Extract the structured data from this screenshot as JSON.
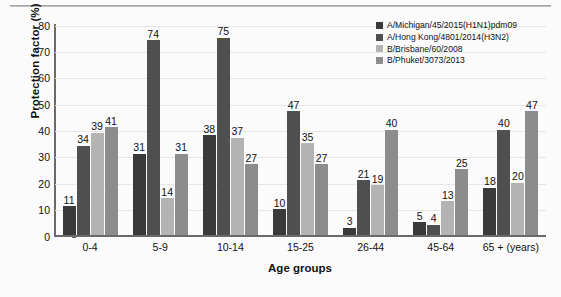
{
  "chart_data": {
    "type": "bar",
    "title": "",
    "xlabel": "Age groups",
    "ylabel": "Protection factor (%)",
    "categories": [
      "0-4",
      "5-9",
      "10-14",
      "15-25",
      "26-44",
      "45-64",
      "65 + (years)"
    ],
    "ylim": [
      0,
      80
    ],
    "yticks": [
      0,
      10,
      20,
      30,
      40,
      50,
      60,
      70,
      80
    ],
    "grid": true,
    "legend_position": "top-right",
    "series": [
      {
        "name": "A/Michigan/45/2015(H1N1)pdm09",
        "color": "#3a3a3a",
        "values": [
          11,
          31,
          38,
          10,
          3,
          5,
          18
        ]
      },
      {
        "name": "A/Hong Kong/4801/2014(H3N2)",
        "color": "#4f4f4f",
        "values": [
          34,
          74,
          75,
          47,
          21,
          4,
          40
        ]
      },
      {
        "name": "B/Brisbane/60/2008",
        "color": "#b3b3b3",
        "values": [
          39,
          14,
          37,
          35,
          19,
          13,
          20
        ]
      },
      {
        "name": "B/Phuket/3073/2013",
        "color": "#8c8c8c",
        "values": [
          41,
          31,
          27,
          27,
          40,
          25,
          47
        ]
      }
    ]
  }
}
